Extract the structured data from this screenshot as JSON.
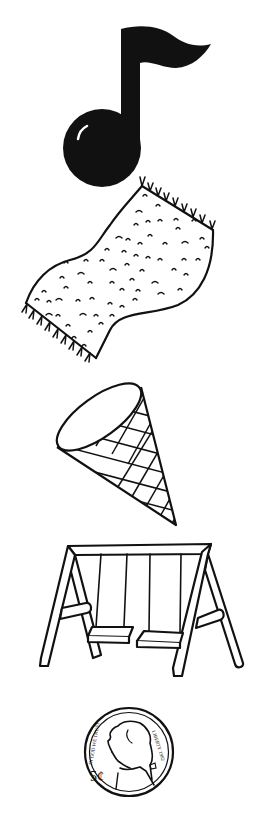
{
  "sheet": {
    "background": "#ffffff",
    "ink": "#111111",
    "items": [
      {
        "id": "music-note",
        "label": "music note"
      },
      {
        "id": "rug",
        "label": "rug"
      },
      {
        "id": "cone",
        "label": "ice cream cone"
      },
      {
        "id": "swing",
        "label": "swing set"
      },
      {
        "id": "nickel",
        "label": "nickel"
      }
    ]
  },
  "nickel": {
    "denomination": "5¢",
    "left_inscription": "IN GOD WE TRUST",
    "right_inscription": "LIBERTY 1982"
  }
}
